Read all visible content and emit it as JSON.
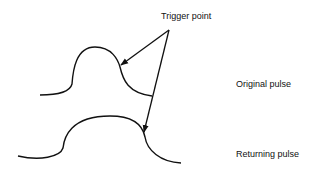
{
  "diagram": {
    "labels": {
      "trigger_point": "Trigger point",
      "original_pulse": "Original pulse",
      "returning_pulse": "Returning pulse"
    },
    "elements": [
      "original pulse waveform",
      "returning pulse waveform",
      "two arrows from trigger point label to trailing edges"
    ],
    "stroke_color": "#111111",
    "background": "#ffffff"
  }
}
